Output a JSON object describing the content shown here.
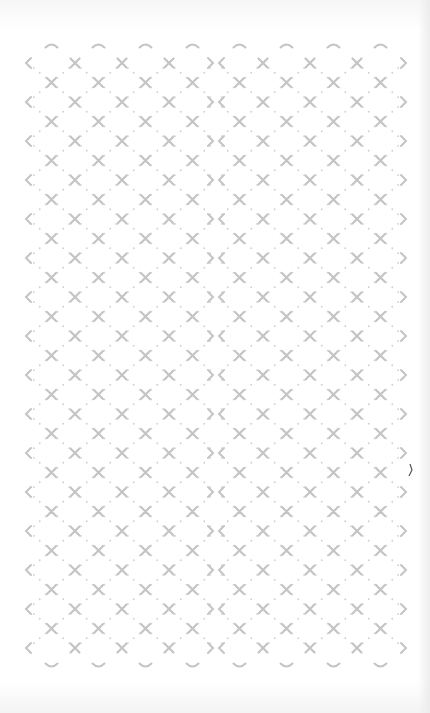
{
  "screen": {
    "description": "Decorative repeating lattice background pattern",
    "pattern": {
      "motif": "x-cross-with-dots",
      "border_motifs": [
        "chevron-left-icon",
        "chevron-right-icon",
        "arc-top-icon",
        "arc-bottom-icon"
      ],
      "columns_per_half": 4,
      "halves": 2,
      "rows": 15,
      "h_period_px": 47,
      "v_period_px": 39,
      "origin": {
        "x": 28,
        "y": 63
      },
      "seam_x": 216
    },
    "colors": {
      "background": "#ffffff",
      "motif": "#c4c4c4",
      "dot": "#cfcfcf",
      "stray_mark": "#555555"
    }
  }
}
